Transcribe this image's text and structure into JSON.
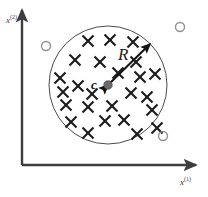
{
  "figure": {
    "background_color": "#ffffff",
    "width": 208,
    "height": 197
  },
  "axes": {
    "origin": {
      "x": 22,
      "y": 165
    },
    "color": "#3d3d3d",
    "x_axis": {
      "name": "x-axis",
      "label_text": "x",
      "label_superscript": "(1)",
      "label_position": {
        "x": 180,
        "y": 176
      },
      "end": {
        "x": 196,
        "y": 165
      }
    },
    "y_axis": {
      "name": "y-axis",
      "label_text": "x",
      "label_superscript": "(2)",
      "label_position": {
        "x": 6,
        "y": 14
      },
      "end": {
        "x": 22,
        "y": 10
      }
    }
  },
  "ball": {
    "name": "enclosing-ball",
    "center": {
      "x": 108,
      "y": 85
    },
    "radius": 59,
    "stroke_color": "#4a4a4a",
    "stroke_width": 1,
    "fill": "none"
  },
  "center_point": {
    "name": "ball-center-point",
    "x": 108,
    "y": 85,
    "radius": 4.2,
    "color": "#6b6b6b",
    "stroke_color": "#4a4a4a",
    "label": "c"
  },
  "radius_arrow": {
    "name": "radius-arrow",
    "label": "R",
    "from": {
      "x": 108,
      "y": 85
    },
    "to": {
      "x": 150,
      "y": 44
    },
    "color": "#121212",
    "stroke_width": 2,
    "double_headed": true,
    "label_position": {
      "x": 118,
      "y": 46
    }
  },
  "labels": {
    "radius": "R",
    "center": "c"
  },
  "inliers": {
    "name": "inlier-points",
    "marker": "cross-marker",
    "color": "#1c1c1c",
    "size": 5.5,
    "stroke_width": 2.1,
    "count": 25,
    "points": [
      {
        "x": 88,
        "y": 41
      },
      {
        "x": 110,
        "y": 40
      },
      {
        "x": 133,
        "y": 42
      },
      {
        "x": 75,
        "y": 60
      },
      {
        "x": 100,
        "y": 62
      },
      {
        "x": 60,
        "y": 78
      },
      {
        "x": 78,
        "y": 86
      },
      {
        "x": 140,
        "y": 77
      },
      {
        "x": 155,
        "y": 74
      },
      {
        "x": 131,
        "y": 93
      },
      {
        "x": 147,
        "y": 97
      },
      {
        "x": 66,
        "y": 105
      },
      {
        "x": 88,
        "y": 107
      },
      {
        "x": 112,
        "y": 106
      },
      {
        "x": 152,
        "y": 110
      },
      {
        "x": 105,
        "y": 121
      },
      {
        "x": 124,
        "y": 120
      },
      {
        "x": 88,
        "y": 133
      },
      {
        "x": 137,
        "y": 134
      },
      {
        "x": 118,
        "y": 73
      },
      {
        "x": 92,
        "y": 94
      },
      {
        "x": 63,
        "y": 92
      },
      {
        "x": 136,
        "y": 62
      },
      {
        "x": 71,
        "y": 122
      },
      {
        "x": 157,
        "y": 128
      }
    ]
  },
  "outliers": {
    "name": "outlier-points",
    "marker": "circle-marker",
    "color": "#8f8f8f",
    "radius": 4.5,
    "stroke_width": 1.4,
    "count": 3,
    "points": [
      {
        "x": 46,
        "y": 46
      },
      {
        "x": 180,
        "y": 27
      },
      {
        "x": 163,
        "y": 136
      }
    ]
  },
  "colors": {
    "axis": "#3d3d3d",
    "ball_stroke": "#4a4a4a",
    "inlier": "#1c1c1c",
    "outlier": "#8f8f8f",
    "arrow": "#121212",
    "center_fill": "#6b6b6b",
    "background": "#ffffff"
  }
}
